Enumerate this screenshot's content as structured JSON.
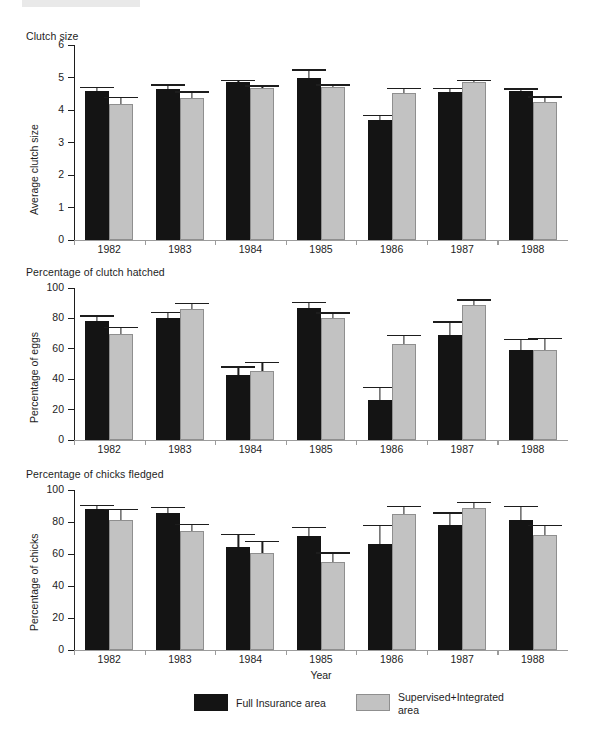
{
  "figure": {
    "xaxis_title": "Year",
    "years": [
      "1982",
      "1983",
      "1984",
      "1985",
      "1986",
      "1987",
      "1988"
    ]
  },
  "legend": {
    "items": [
      {
        "label": "Full Insurance area",
        "color": "#141414",
        "swatch": "dark-swatch"
      },
      {
        "label": "Supervised+Integrated\narea",
        "color": "#c2c2c2",
        "swatch": "light-swatch"
      }
    ]
  },
  "chart_data": [
    {
      "type": "bar",
      "title": "Clutch size",
      "xlabel": "",
      "ylabel": "Average clutch size",
      "ylim": [
        0,
        6
      ],
      "yticks": [
        0,
        1,
        2,
        3,
        4,
        5,
        6
      ],
      "ytick_labels": [
        "0",
        "1",
        "2",
        "3",
        "4",
        "5",
        "6"
      ],
      "grid": false,
      "categories": [
        "1982",
        "1983",
        "1984",
        "1985",
        "1986",
        "1987",
        "1988"
      ],
      "series": [
        {
          "name": "Full Insurance area",
          "color": "#141414",
          "values": [
            4.58,
            4.66,
            4.86,
            4.99,
            3.68,
            4.55,
            4.57
          ],
          "errors": [
            0.13,
            0.13,
            0.06,
            0.26,
            0.17,
            0.14,
            0.1
          ]
        },
        {
          "name": "Supervised+Integrated area",
          "color": "#c2c2c2",
          "values": [
            4.2,
            4.36,
            4.68,
            4.72,
            4.52,
            4.86,
            4.25
          ],
          "errors": [
            0.2,
            0.21,
            0.08,
            0.07,
            0.17,
            0.07,
            0.17
          ]
        }
      ]
    },
    {
      "type": "bar",
      "title": "Percentage of clutch hatched",
      "xlabel": "",
      "ylabel": "Percentage of eggs",
      "ylim": [
        0,
        100
      ],
      "yticks": [
        0,
        20,
        40,
        60,
        80,
        100
      ],
      "ytick_labels": [
        "0",
        "20",
        "40",
        "60",
        "80",
        "100"
      ],
      "grid": false,
      "categories": [
        "1982",
        "1983",
        "1984",
        "1985",
        "1986",
        "1987",
        "1988"
      ],
      "series": [
        {
          "name": "Full Insurance area",
          "color": "#141414",
          "values": [
            78,
            80.5,
            42.5,
            87,
            26,
            69,
            59.5
          ],
          "errors": [
            4,
            4,
            6,
            4,
            9,
            9,
            7
          ]
        },
        {
          "name": "Supervised+Integrated area",
          "color": "#c2c2c2",
          "values": [
            70,
            86,
            45.5,
            80,
            63,
            89,
            59
          ],
          "errors": [
            4.5,
            4,
            6,
            4,
            6,
            3.5,
            8
          ]
        }
      ]
    },
    {
      "type": "bar",
      "title": "Percentage of chicks fledged",
      "xlabel": "Year",
      "ylabel": "Percentage of chicks",
      "ylim": [
        0,
        100
      ],
      "yticks": [
        0,
        20,
        40,
        60,
        80,
        100
      ],
      "ytick_labels": [
        "0",
        "20",
        "40",
        "60",
        "80",
        "100"
      ],
      "grid": false,
      "categories": [
        "1982",
        "1983",
        "1984",
        "1985",
        "1986",
        "1987",
        "1988"
      ],
      "series": [
        {
          "name": "Full Insurance area",
          "color": "#141414",
          "values": [
            88,
            85.5,
            64.5,
            71,
            66,
            78,
            81
          ],
          "errors": [
            2.5,
            4,
            8,
            6,
            12,
            8,
            9
          ]
        },
        {
          "name": "Supervised+Integrated area",
          "color": "#c2c2c2",
          "values": [
            81,
            74.5,
            60.5,
            55,
            85,
            88.5,
            72
          ],
          "errors": [
            7,
            4.5,
            7.5,
            6,
            5,
            4,
            6
          ]
        }
      ]
    }
  ]
}
